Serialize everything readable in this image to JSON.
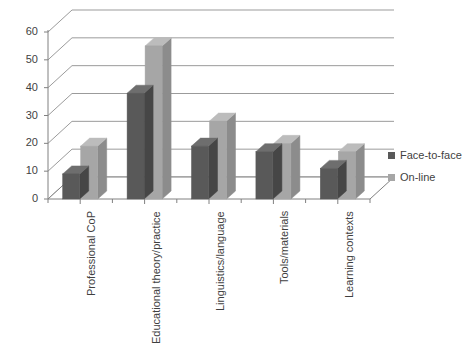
{
  "chart_data": {
    "type": "bar",
    "title": "",
    "subtitle": "",
    "xlabel": "",
    "ylabel": "",
    "categories": [
      "Professional CoP",
      "Educational theory/practice",
      "Linguistics/language",
      "Tools/materials",
      "Learning contexts"
    ],
    "series": [
      {
        "name": "Face-to-face",
        "color": "#595959",
        "values": [
          9,
          38,
          19,
          17,
          11
        ]
      },
      {
        "name": "On-line",
        "color": "#a6a6a6",
        "values": [
          19,
          55,
          28,
          20,
          17
        ]
      }
    ],
    "ylim": [
      0,
      60
    ],
    "yticks": [
      0,
      10,
      20,
      30,
      40,
      50,
      60
    ],
    "ytick_labels": [
      "0",
      "10",
      "20",
      "30",
      "40",
      "50",
      "60"
    ],
    "grid": true,
    "grid_axis": "y",
    "legend_position": "right",
    "style": "3d-clustered-column",
    "annotations": []
  },
  "legend": {
    "entries": [
      {
        "label": "Face-to-face",
        "swatch": "#595959",
        "marker": "square-swatch"
      },
      {
        "label": "On-line",
        "swatch": "#a6a6a6",
        "marker": "square-swatch"
      }
    ]
  },
  "colors": {
    "background": "#ffffff",
    "gridline": "#9b9b9b",
    "axis": "#808080",
    "floor": "#ffffff",
    "text": "#3f3f3f",
    "series_face_to_face": "#595959",
    "series_face_to_face_top": "#6e6e6e",
    "series_face_to_face_side": "#464646",
    "series_online": "#a6a6a6",
    "series_online_top": "#bcbcbc",
    "series_online_side": "#8c8c8c"
  }
}
